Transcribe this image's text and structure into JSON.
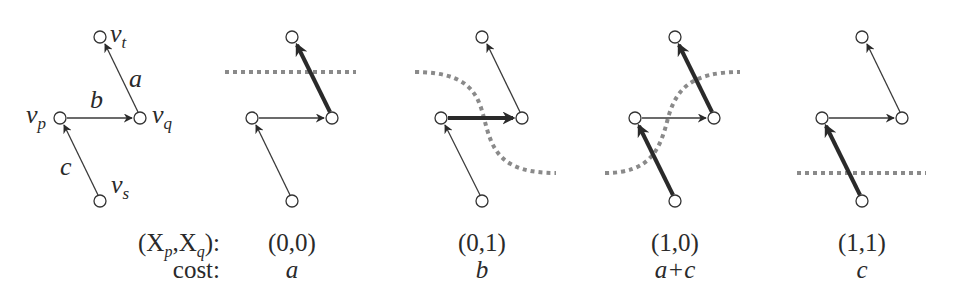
{
  "graph": {
    "nodes": [
      {
        "id": "v_t",
        "label": "v",
        "sub": "t"
      },
      {
        "id": "v_p",
        "label": "v",
        "sub": "p"
      },
      {
        "id": "v_q",
        "label": "v",
        "sub": "q"
      },
      {
        "id": "v_s",
        "label": "v",
        "sub": "s"
      }
    ],
    "edges": [
      {
        "from": "v_q",
        "to": "v_t",
        "label": "a"
      },
      {
        "from": "v_p",
        "to": "v_q",
        "label": "b"
      },
      {
        "from": "v_s",
        "to": "v_p",
        "label": "c"
      }
    ]
  },
  "table": {
    "row1_header": {
      "open": "(X",
      "sub1": "p",
      "mid": ",X",
      "sub2": "q",
      "close": "):"
    },
    "row2_header": "cost:",
    "columns": [
      {
        "assignment": "(0,0)",
        "cost": "a",
        "cut_edges": [
          "a"
        ]
      },
      {
        "assignment": "(0,1)",
        "cost": "b",
        "cut_edges": [
          "b"
        ]
      },
      {
        "assignment": "(1,0)",
        "cost": "a+c",
        "cut_edges": [
          "a",
          "c"
        ]
      },
      {
        "assignment": "(1,1)",
        "cost": "c",
        "cut_edges": [
          "c"
        ]
      }
    ]
  },
  "colors": {
    "edge": "#3a3a3a",
    "cut_edge": "#2a2a2a",
    "cut_line": "#8a8a8a",
    "background": "#ffffff"
  }
}
